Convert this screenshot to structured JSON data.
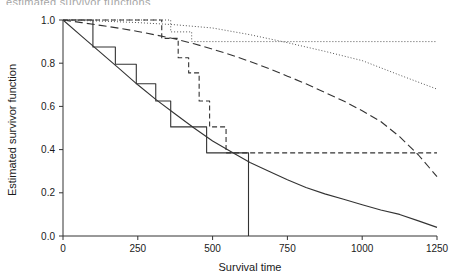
{
  "figure": {
    "top_cut_text": "estimated survivor functions",
    "background": "#ffffff",
    "ink_color": "#333333"
  },
  "chart_data": {
    "type": "line",
    "title": "",
    "xlabel": "Survival time",
    "ylabel": "Estimated survivor function",
    "xlim": [
      0,
      1250
    ],
    "ylim": [
      0.0,
      1.0
    ],
    "xticks": [
      0,
      250,
      500,
      750,
      1000,
      1250
    ],
    "xtick_labels": [
      "0",
      "250",
      "500",
      "750",
      "1000",
      "1250"
    ],
    "yticks": [
      0.0,
      0.2,
      0.4,
      0.6,
      0.8,
      1.0
    ],
    "ytick_labels": [
      "0.0",
      "0.2",
      "0.4",
      "0.6",
      "0.8",
      "1.0"
    ],
    "grid": false,
    "legend": "none",
    "series": [
      {
        "name": "Kaplan-Meier group 1 (solid step)",
        "style": "solid",
        "shape": "step",
        "color": "#333333",
        "x": [
          0,
          100,
          100,
          175,
          175,
          245,
          245,
          310,
          310,
          360,
          360,
          480,
          480,
          620,
          620,
          620
        ],
        "y": [
          1.0,
          1.0,
          0.875,
          0.875,
          0.795,
          0.795,
          0.705,
          0.705,
          0.625,
          0.625,
          0.505,
          0.505,
          0.385,
          0.385,
          0.385,
          0.0
        ]
      },
      {
        "name": "Parametric fit group 1 (solid smooth)",
        "style": "solid",
        "shape": "smooth",
        "color": "#333333",
        "x": [
          0,
          62,
          125,
          188,
          250,
          312,
          375,
          438,
          500,
          562,
          625,
          688,
          750,
          812,
          875,
          938,
          1000,
          1062,
          1125,
          1188,
          1250
        ],
        "y": [
          1.0,
          0.925,
          0.85,
          0.775,
          0.7,
          0.63,
          0.565,
          0.5,
          0.44,
          0.39,
          0.34,
          0.3,
          0.26,
          0.225,
          0.195,
          0.17,
          0.145,
          0.12,
          0.1,
          0.07,
          0.04
        ]
      },
      {
        "name": "Kaplan-Meier group 2 (dashed step)",
        "style": "dashed",
        "shape": "step",
        "color": "#333333",
        "x": [
          0,
          330,
          330,
          385,
          385,
          420,
          420,
          455,
          455,
          490,
          490,
          545,
          545,
          1250
        ],
        "y": [
          1.0,
          1.0,
          0.915,
          0.915,
          0.825,
          0.825,
          0.755,
          0.755,
          0.625,
          0.625,
          0.505,
          0.505,
          0.385,
          0.385
        ]
      },
      {
        "name": "Parametric fit group 2 (long dash smooth)",
        "style": "longdash",
        "shape": "smooth",
        "color": "#333333",
        "x": [
          0,
          62,
          125,
          188,
          250,
          312,
          375,
          438,
          500,
          562,
          625,
          688,
          750,
          812,
          875,
          938,
          1000,
          1062,
          1125,
          1188,
          1250
        ],
        "y": [
          1.0,
          0.988,
          0.975,
          0.962,
          0.947,
          0.93,
          0.912,
          0.89,
          0.865,
          0.838,
          0.808,
          0.775,
          0.74,
          0.705,
          0.665,
          0.625,
          0.58,
          0.53,
          0.46,
          0.375,
          0.275
        ]
      },
      {
        "name": "Kaplan-Meier group 3 (dotted step)",
        "style": "dotted",
        "shape": "step",
        "color": "#555555",
        "x": [
          0,
          360,
          360,
          430,
          430,
          1250
        ],
        "y": [
          1.0,
          1.0,
          0.945,
          0.945,
          0.9,
          0.9
        ]
      },
      {
        "name": "Parametric fit group 3 (dotted smooth)",
        "style": "dotted",
        "shape": "smooth",
        "color": "#555555",
        "x": [
          0,
          125,
          250,
          375,
          500,
          625,
          750,
          875,
          1000,
          1125,
          1250
        ],
        "y": [
          1.0,
          0.995,
          0.988,
          0.978,
          0.963,
          0.932,
          0.895,
          0.855,
          0.812,
          0.745,
          0.68
        ]
      }
    ]
  }
}
